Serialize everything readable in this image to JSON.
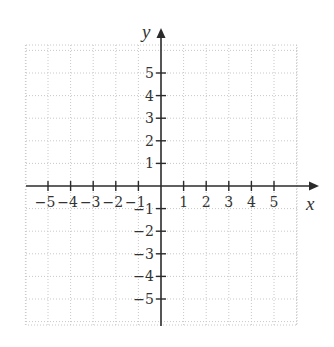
{
  "diagram": {
    "type": "cartesian-coordinate-grid",
    "x_axis": {
      "label": "x",
      "ticks": [
        -5,
        -4,
        -3,
        -2,
        -1,
        1,
        2,
        3,
        4,
        5
      ]
    },
    "y_axis": {
      "label": "y",
      "ticks": [
        5,
        4,
        3,
        2,
        1,
        -1,
        -2,
        -3,
        -4,
        -5
      ]
    },
    "grid": {
      "style": "dotted",
      "x_range": [
        -6,
        6
      ],
      "y_range": [
        -6,
        6
      ]
    },
    "colors": {
      "axis": "#2b2b2b",
      "grid": "#c8c8c8",
      "text": "#333333"
    }
  },
  "labels": {
    "x_axis": "x",
    "y_axis": "y",
    "x_ticks": [
      "−5",
      "−4",
      "−3",
      "−2",
      "−1",
      "1",
      "2",
      "3",
      "4",
      "5"
    ],
    "y_ticks": [
      "5",
      "4",
      "3",
      "2",
      "1",
      "−1",
      "−2",
      "−3",
      "−4",
      "−5"
    ]
  }
}
